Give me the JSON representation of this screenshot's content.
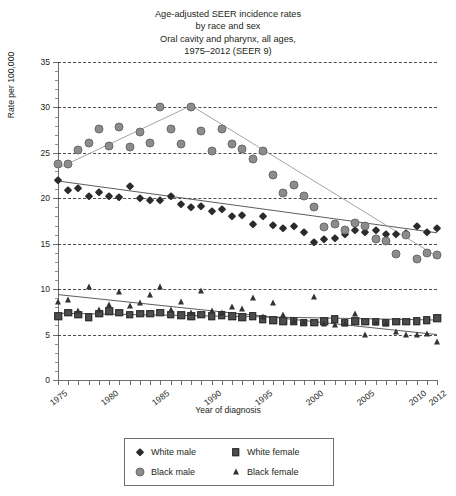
{
  "title": {
    "line1": "Age-adjusted SEER incidence rates",
    "line2": "by race and sex",
    "line3": "Oral cavity and pharynx, all ages,",
    "line4": "1975–2012 (SEER 9)"
  },
  "axes": {
    "xlabel": "Year of diagnosis",
    "ylabel": "Rate per 100,000",
    "ytick_labels": [
      "0",
      "5",
      "10",
      "15",
      "20",
      "25",
      "30",
      "35"
    ],
    "xtick_labels": [
      "1975",
      "1980",
      "1985",
      "1990",
      "1995",
      "2000",
      "2005",
      "2010",
      "2012"
    ]
  },
  "legend": {
    "items": [
      {
        "label": "White male",
        "marker": "diamond-marker",
        "color": "#2b2b2b"
      },
      {
        "label": "White female",
        "marker": "square-marker",
        "color": "#4d4d4d"
      },
      {
        "label": "Black male",
        "marker": "circle-marker",
        "color": "#8c8c8c"
      },
      {
        "label": "Black female",
        "marker": "triangle-marker",
        "color": "#333333"
      }
    ]
  },
  "chart_data": {
    "type": "scatter",
    "xlabel": "Year of diagnosis",
    "ylabel": "Rate per 100,000",
    "xlim": [
      1975,
      2012
    ],
    "ylim": [
      0,
      35
    ],
    "ytick_step": 5,
    "grid": "horizontal-dashed",
    "legend_position": "bottom-center",
    "x": [
      1975,
      1976,
      1977,
      1978,
      1979,
      1980,
      1981,
      1982,
      1983,
      1984,
      1985,
      1986,
      1987,
      1988,
      1989,
      1990,
      1991,
      1992,
      1993,
      1994,
      1995,
      1996,
      1997,
      1998,
      1999,
      2000,
      2001,
      2002,
      2003,
      2004,
      2005,
      2006,
      2007,
      2008,
      2009,
      2010,
      2011,
      2012
    ],
    "series": [
      {
        "name": "White male",
        "marker": "diamond",
        "color": "#2b2b2b",
        "values": [
          22.0,
          20.9,
          21.1,
          20.3,
          20.7,
          20.2,
          20.1,
          21.4,
          20.0,
          19.8,
          19.8,
          20.2,
          19.4,
          19.0,
          19.2,
          18.6,
          18.8,
          18.0,
          18.2,
          17.2,
          18.0,
          17.1,
          16.7,
          16.9,
          16.3,
          15.2,
          15.5,
          15.6,
          16.1,
          16.5,
          16.3,
          16.5,
          16.1,
          16.1,
          16.2,
          16.9,
          16.3,
          16.7
        ],
        "trend": [
          [
            1975,
            21.9
          ],
          [
            2012,
            16.2
          ]
        ]
      },
      {
        "name": "White female",
        "marker": "square",
        "color": "#4d4d4d",
        "values": [
          7.0,
          7.4,
          7.2,
          6.9,
          7.3,
          7.6,
          7.4,
          7.2,
          7.3,
          7.3,
          7.4,
          7.2,
          7.1,
          7.0,
          7.2,
          7.0,
          7.1,
          7.0,
          6.9,
          7.0,
          6.7,
          6.6,
          6.5,
          6.5,
          6.3,
          6.3,
          6.5,
          6.7,
          6.3,
          6.5,
          6.4,
          6.4,
          6.3,
          6.4,
          6.4,
          6.5,
          6.6,
          6.8
        ],
        "trend": [
          [
            1975,
            7.35
          ],
          [
            2012,
            6.6
          ]
        ]
      },
      {
        "name": "Black male",
        "marker": "circle",
        "color": "#8c8c8c",
        "values": [
          23.8,
          23.8,
          25.3,
          26.1,
          27.6,
          25.7,
          27.8,
          25.6,
          27.3,
          26.1,
          30.0,
          27.6,
          26.0,
          30.0,
          27.4,
          25.2,
          27.6,
          26.0,
          25.4,
          24.3,
          25.2,
          22.6,
          20.6,
          21.5,
          20.3,
          19.0,
          16.8,
          17.2,
          16.5,
          17.3,
          16.9,
          15.5,
          15.3,
          13.9,
          16.0,
          13.3,
          14.0,
          13.8
        ],
        "trend": [
          [
            1975,
            23.3
          ],
          [
            1988,
            30.2
          ],
          [
            2012,
            13.6
          ]
        ]
      },
      {
        "name": "Black female",
        "marker": "triangle",
        "color": "#333333",
        "values": [
          8.6,
          8.8,
          7.6,
          10.2,
          7.7,
          8.2,
          9.7,
          8.1,
          8.5,
          9.4,
          10.2,
          7.7,
          8.6,
          7.4,
          9.8,
          7.6,
          7.4,
          8.0,
          7.8,
          9.0,
          6.9,
          8.5,
          7.2,
          6.5,
          6.4,
          9.1,
          6.2,
          6.0,
          6.2,
          7.3,
          5.0,
          6.3,
          6.2,
          5.3,
          4.9,
          5.0,
          5.1,
          4.2
        ],
        "trend": [
          [
            1975,
            9.4
          ],
          [
            2012,
            5.0
          ]
        ]
      }
    ]
  }
}
